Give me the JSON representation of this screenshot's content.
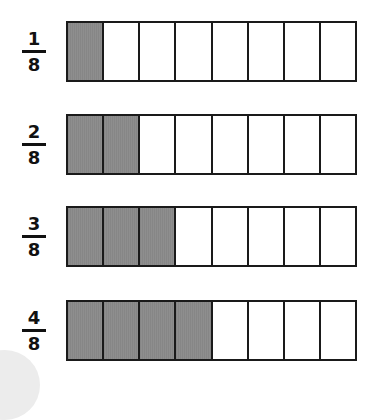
{
  "diagram": {
    "title": "",
    "total_parts": 8,
    "colors": {
      "shaded": "#8e8e8e",
      "unshaded": "#ffffff",
      "border": "#1a1a1a"
    },
    "rows": [
      {
        "numerator": "1",
        "denominator": "8",
        "shaded": 1,
        "top": 21
      },
      {
        "numerator": "2",
        "denominator": "8",
        "shaded": 2,
        "top": 114
      },
      {
        "numerator": "3",
        "denominator": "8",
        "shaded": 3,
        "top": 206
      },
      {
        "numerator": "4",
        "denominator": "8",
        "shaded": 4,
        "top": 300
      }
    ]
  }
}
